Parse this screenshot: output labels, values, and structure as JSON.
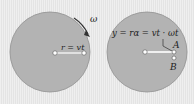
{
  "diagram": {
    "left_disc": {
      "omega_label": "ω",
      "radius_label": "r = vt"
    },
    "right_disc": {
      "displacement_label": "y = rα = vt · ωt",
      "point_a_label": "A",
      "point_b_label": "B"
    },
    "colors": {
      "background": "#ececec",
      "disc_fill": "#b3b3b3",
      "disc_edge": "#8a8a8a",
      "line": "#ffffff",
      "text": "#222222"
    }
  }
}
